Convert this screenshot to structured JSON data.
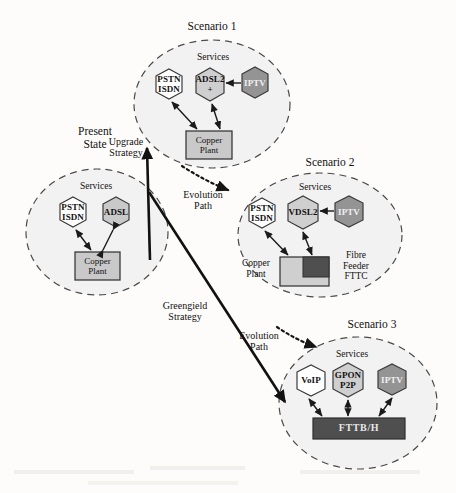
{
  "diagram": {
    "background_color": "#fdfcfa",
    "clusters": [
      {
        "id": "present-state",
        "title": "Present\nState",
        "services_label": "Services",
        "nodes": [
          {
            "id": "pstn-isdn",
            "label": "PSTN\nISDN",
            "shape": "hexagon",
            "fill": "#ffffff"
          },
          {
            "id": "adsl",
            "label": "ADSL",
            "shape": "hexagon",
            "fill": "#c9c9c9"
          }
        ],
        "infrastructure": [
          {
            "id": "copper-plant",
            "label": "Copper\nPlant",
            "shape": "rect",
            "fill": "#c9c9c9"
          }
        ]
      },
      {
        "id": "scenario-1",
        "title": "Scenario 1",
        "services_label": "Services",
        "nodes": [
          {
            "id": "pstn-isdn",
            "label": "PSTN\nISDN",
            "shape": "hexagon",
            "fill": "#ffffff"
          },
          {
            "id": "adsl2plus",
            "label": "ADSL2\n+",
            "shape": "hexagon",
            "fill": "#cfcfcf"
          },
          {
            "id": "iptv",
            "label": "IPTV",
            "shape": "hexagon",
            "fill": "#949494"
          }
        ],
        "infrastructure": [
          {
            "id": "copper-plant",
            "label": "Copper\nPlant",
            "shape": "rect",
            "fill": "#c9c9c9"
          }
        ]
      },
      {
        "id": "scenario-2",
        "title": "Scenario 2",
        "services_label": "Services",
        "nodes": [
          {
            "id": "pstn-isdn",
            "label": "PSTN\nISDN",
            "shape": "hexagon",
            "fill": "#ffffff"
          },
          {
            "id": "vdsl2",
            "label": "VDSL2",
            "shape": "hexagon",
            "fill": "#cfcfcf"
          },
          {
            "id": "iptv",
            "label": "IPTV",
            "shape": "hexagon",
            "fill": "#949494"
          }
        ],
        "infrastructure": [
          {
            "id": "copper-plant",
            "label": "Copper\nPlant",
            "shape": "composite-left",
            "fill": "#cfcfcf"
          },
          {
            "id": "fibre-feeder",
            "label": "Fibre\nFeeder\nFTTC",
            "shape": "composite-right",
            "fill": "#4f4f4f"
          }
        ]
      },
      {
        "id": "scenario-3",
        "title": "Scenario 3",
        "services_label": "Services",
        "nodes": [
          {
            "id": "voip",
            "label": "VoIP",
            "shape": "hexagon",
            "fill": "#ffffff"
          },
          {
            "id": "gpon-p2p",
            "label": "GPON\nP2P",
            "shape": "hexagon",
            "fill": "#cfcfcf"
          },
          {
            "id": "iptv",
            "label": "IPTV",
            "shape": "hexagon",
            "fill": "#949494"
          }
        ],
        "infrastructure": [
          {
            "id": "fttbh",
            "label": "FTTB/H",
            "shape": "bar",
            "fill": "#4f4f4f"
          }
        ]
      }
    ],
    "transitions": [
      {
        "id": "upgrade-strategy",
        "label": "Upgrade\nStrategy",
        "style": "solid-thick"
      },
      {
        "id": "greenfield-strategy",
        "label": "Greengield\nStrategy",
        "style": "solid-thick"
      },
      {
        "id": "evolution-path-1",
        "label": "Evolution\nPath",
        "style": "dotted"
      },
      {
        "id": "evolution-path-2",
        "label": "Evolution\nPath",
        "style": "dotted"
      }
    ]
  }
}
